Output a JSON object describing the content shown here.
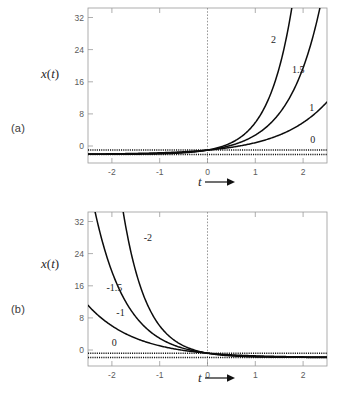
{
  "figure": {
    "panels": [
      {
        "tag": "(a)",
        "ylabel_x": "x",
        "ylabel_paren_open": "(",
        "ylabel_t": "t",
        "ylabel_paren_close": ")",
        "xlabel_t": "t",
        "xlabel_arrow": "arrow-right-icon"
      },
      {
        "tag": "(b)",
        "ylabel_x": "x",
        "ylabel_paren_open": "(",
        "ylabel_t": "t",
        "ylabel_paren_close": ")",
        "xlabel_t": "t",
        "xlabel_arrow": "arrow-right-icon"
      }
    ]
  },
  "chart_data": [
    {
      "type": "line",
      "panel": "(a)",
      "title": "",
      "xlabel": "t",
      "ylabel": "x(t)",
      "xlim": [
        -2.5,
        2.5
      ],
      "ylim": [
        -2.0,
        34.0
      ],
      "xticks": [
        -2,
        -1,
        0,
        1,
        2
      ],
      "xticklabels": [
        "-2",
        "-1",
        "0",
        "1",
        "2"
      ],
      "yticks": [
        0,
        8,
        16,
        24,
        32
      ],
      "yticklabels": [
        "0",
        "8",
        "16",
        "24",
        "32"
      ],
      "grid": false,
      "legend_position": "inline-curve-labels",
      "annotations": [
        {
          "text": "2",
          "x": 1.38,
          "y": 26.5
        },
        {
          "text": "1.5",
          "x": 1.9,
          "y": 19.5
        },
        {
          "text": "1",
          "x": 2.18,
          "y": 10.8
        },
        {
          "text": "0",
          "x": 2.2,
          "y": 3.4
        }
      ],
      "series": [
        {
          "name": "2",
          "formula": "exp(2t)",
          "a": 2,
          "x": [
            -2.5,
            -2.0,
            -1.5,
            -1.0,
            -0.5,
            0.0,
            0.5,
            1.0,
            1.25,
            1.5,
            1.7329
          ],
          "values": [
            0.0067,
            0.0183,
            0.0498,
            0.1353,
            0.3679,
            1.0,
            2.7183,
            7.3891,
            12.182,
            20.086,
            32.0
          ]
        },
        {
          "name": "1.5",
          "formula": "exp(1.5t)",
          "a": 1.5,
          "x": [
            -2.5,
            -2.0,
            -1.5,
            -1.0,
            -0.5,
            0.0,
            0.5,
            1.0,
            1.5,
            2.0,
            2.3105
          ],
          "values": [
            0.0235,
            0.0498,
            0.1054,
            0.2231,
            0.4724,
            1.0,
            2.117,
            4.4817,
            9.4877,
            20.086,
            32.0
          ]
        },
        {
          "name": "1",
          "formula": "exp(t)",
          "a": 1,
          "x": [
            -2.5,
            -2.0,
            -1.5,
            -1.0,
            -0.5,
            0.0,
            0.5,
            1.0,
            1.5,
            2.0,
            2.5
          ],
          "values": [
            0.0821,
            0.1353,
            0.2231,
            0.3679,
            0.6065,
            1.0,
            1.6487,
            2.7183,
            4.4817,
            7.3891,
            12.182
          ]
        },
        {
          "name": "0",
          "formula": "exp(0t) = 1",
          "a": 0,
          "style": "dotted",
          "x": [
            -2.5,
            2.5
          ],
          "values": [
            1.0,
            1.0
          ]
        },
        {
          "name": "zero-axis",
          "formula": "x = 0",
          "style": "dotted",
          "x": [
            -2.5,
            2.5
          ],
          "values": [
            0.0,
            0.0
          ]
        }
      ]
    },
    {
      "type": "line",
      "panel": "(b)",
      "title": "",
      "xlabel": "t",
      "ylabel": "x(t)",
      "xlim": [
        -2.5,
        2.5
      ],
      "ylim": [
        -2.0,
        34.0
      ],
      "xticks": [
        -2,
        -1,
        0,
        1,
        2
      ],
      "xticklabels": [
        "-2",
        "-1",
        "0",
        "1",
        "2"
      ],
      "yticks": [
        0,
        8,
        16,
        24,
        32
      ],
      "yticklabels": [
        "0",
        "8",
        "16",
        "24",
        "32"
      ],
      "grid": false,
      "legend_position": "inline-curve-labels",
      "annotations": [
        {
          "text": "-2",
          "x": -1.25,
          "y": 28.0
        },
        {
          "text": "-1.5",
          "x": -1.95,
          "y": 16.2
        },
        {
          "text": "-1",
          "x": -1.82,
          "y": 10.4
        },
        {
          "text": "0",
          "x": -1.95,
          "y": 3.4
        }
      ],
      "series": [
        {
          "name": "-2",
          "formula": "exp(-2t)",
          "a": -2,
          "x": [
            -1.7329,
            -1.5,
            -1.25,
            -1.0,
            -0.5,
            0.0,
            0.5,
            1.0,
            1.5,
            2.0,
            2.5
          ],
          "values": [
            32.0,
            20.086,
            12.182,
            7.3891,
            2.7183,
            1.0,
            0.3679,
            0.1353,
            0.0498,
            0.0183,
            0.0067
          ]
        },
        {
          "name": "-1.5",
          "formula": "exp(-1.5t)",
          "a": -1.5,
          "x": [
            -2.3105,
            -2.0,
            -1.5,
            -1.0,
            -0.5,
            0.0,
            0.5,
            1.0,
            1.5,
            2.0,
            2.5
          ],
          "values": [
            32.0,
            20.086,
            9.4877,
            4.4817,
            2.117,
            1.0,
            0.4724,
            0.2231,
            0.1054,
            0.0498,
            0.0235
          ]
        },
        {
          "name": "-1",
          "formula": "exp(-t)",
          "a": -1,
          "x": [
            -2.5,
            -2.0,
            -1.5,
            -1.0,
            -0.5,
            0.0,
            0.5,
            1.0,
            1.5,
            2.0,
            2.5
          ],
          "values": [
            12.182,
            7.3891,
            4.4817,
            2.7183,
            1.6487,
            1.0,
            0.6065,
            0.3679,
            0.2231,
            0.1353,
            0.0821
          ]
        },
        {
          "name": "0",
          "formula": "exp(0t) = 1",
          "a": 0,
          "style": "dotted",
          "x": [
            -2.5,
            2.5
          ],
          "values": [
            1.0,
            1.0
          ]
        },
        {
          "name": "zero-axis",
          "formula": "x = 0",
          "style": "dotted",
          "x": [
            -2.5,
            2.5
          ],
          "values": [
            0.0,
            0.0
          ]
        }
      ]
    }
  ]
}
